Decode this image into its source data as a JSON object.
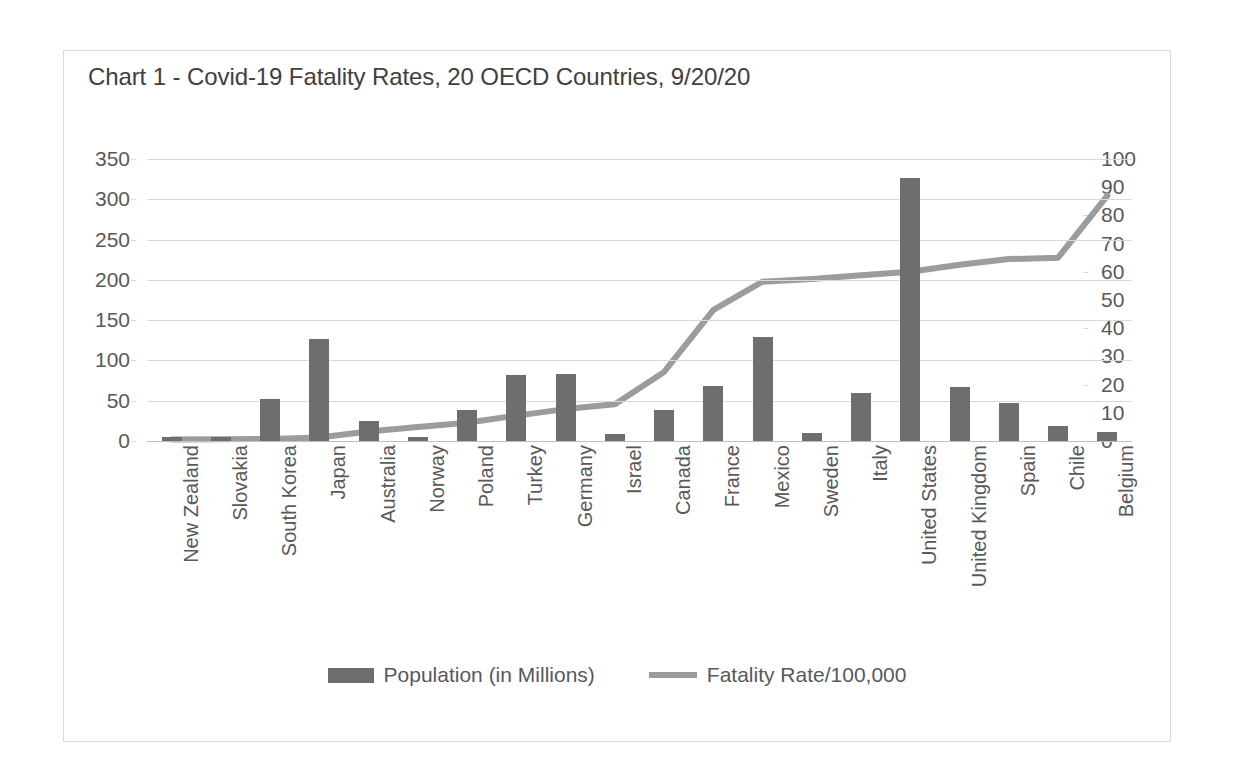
{
  "chart_data": {
    "type": "bar",
    "title": "Chart 1 - Covid-19 Fatality Rates, 20 OECD Countries, 9/20/20",
    "xlabel": "",
    "ylabel": "",
    "grid": true,
    "legend_position": "bottom",
    "categories": [
      "New Zealand",
      "Slovakia",
      "South Korea",
      "Japan",
      "Australia",
      "Norway",
      "Poland",
      "Turkey",
      "Germany",
      "Israel",
      "Canada",
      "France",
      "Mexico",
      "Sweden",
      "Italy",
      "United States",
      "United Kingdom",
      "Spain",
      "Chile",
      "Belgium"
    ],
    "series": [
      {
        "name": "Population (in Millions)",
        "type": "bar",
        "axis": "left",
        "color": "#6e6e6e",
        "values": [
          5,
          5.5,
          52,
          127,
          25,
          5.4,
          38,
          82,
          83,
          9,
          38,
          68,
          129,
          10,
          60,
          327,
          67,
          47,
          19,
          11.5
        ]
      },
      {
        "name": "Fatality Rate/100,000",
        "type": "line",
        "axis": "right",
        "color": "#9c9c9c",
        "values": [
          0.5,
          0.6,
          0.7,
          1.2,
          3.4,
          5.0,
          6.5,
          9.0,
          11.3,
          13.0,
          24.5,
          46.5,
          56.5,
          57.5,
          58.8,
          60.0,
          62.5,
          64.5,
          65.0,
          87.0
        ]
      }
    ],
    "ylim_left": [
      0,
      350
    ],
    "ytick_left": [
      "350",
      "300",
      "250",
      "200",
      "150",
      "100",
      "50",
      "0"
    ],
    "ylim_right": [
      0,
      100
    ],
    "ytick_right": [
      "100",
      "90",
      "80",
      "70",
      "60",
      "50",
      "40",
      "30",
      "20",
      "10",
      "0"
    ]
  },
  "legend": {
    "items": [
      {
        "label": "Population (in Millions)",
        "marker": "bar-swatch"
      },
      {
        "label": "Fatality Rate/100,000",
        "marker": "line-swatch"
      }
    ]
  }
}
